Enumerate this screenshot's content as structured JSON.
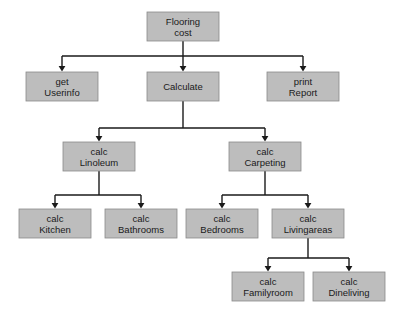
{
  "diagram": {
    "type": "structure-chart",
    "box_fill_color": "#bdbdbd",
    "box_border_color": "#8a8a8a",
    "connector_color": "#1a1a1a",
    "background_color": "#ffffff",
    "box_width": 72,
    "box_height": 29
  },
  "nodes": [
    {
      "id": "flooring-cost",
      "line1": "Flooring",
      "line2": "cost",
      "x": 147,
      "y": 12,
      "level": 0
    },
    {
      "id": "get-userinfo",
      "line1": "get",
      "line2": "Userinfo",
      "x": 26,
      "y": 72,
      "level": 1
    },
    {
      "id": "calculate",
      "line1": "Calculate",
      "line2": "",
      "x": 147,
      "y": 72,
      "level": 1
    },
    {
      "id": "print-report",
      "line1": "print",
      "line2": "Report",
      "x": 267,
      "y": 72,
      "level": 1
    },
    {
      "id": "calc-linoleum",
      "line1": "calc",
      "line2": "Linoleum",
      "x": 63,
      "y": 142,
      "level": 2
    },
    {
      "id": "calc-carpeting",
      "line1": "calc",
      "line2": "Carpeting",
      "x": 229,
      "y": 142,
      "level": 2
    },
    {
      "id": "calc-kitchen",
      "line1": "calc",
      "line2": "Kitchen",
      "x": 19,
      "y": 209,
      "level": 3
    },
    {
      "id": "calc-bathrooms",
      "line1": "calc",
      "line2": "Bathrooms",
      "x": 105,
      "y": 209,
      "level": 3
    },
    {
      "id": "calc-bedrooms",
      "line1": "calc",
      "line2": "Bedrooms",
      "x": 186,
      "y": 209,
      "level": 3
    },
    {
      "id": "calc-livingareas",
      "line1": "calc",
      "line2": "Livingareas",
      "x": 272,
      "y": 209,
      "level": 3
    },
    {
      "id": "calc-familyroom",
      "line1": "calc",
      "line2": "Familyroom",
      "x": 232,
      "y": 272,
      "level": 4
    },
    {
      "id": "calc-dineliving",
      "line1": "calc",
      "line2": "Dineliving",
      "x": 313,
      "y": 272,
      "level": 4
    }
  ],
  "edges": [
    {
      "id": "edge-flooring-to-level1",
      "parent": "flooring-cost",
      "children": [
        "get-userinfo",
        "calculate",
        "print-report"
      ],
      "bus_y": 56
    },
    {
      "id": "edge-calculate-to-level2",
      "parent": "calculate",
      "children": [
        "calc-linoleum",
        "calc-carpeting"
      ],
      "bus_y": 128
    },
    {
      "id": "edge-linoleum-to-level3",
      "parent": "calc-linoleum",
      "children": [
        "calc-kitchen",
        "calc-bathrooms"
      ],
      "bus_y": 195
    },
    {
      "id": "edge-carpeting-to-level3",
      "parent": "calc-carpeting",
      "children": [
        "calc-bedrooms",
        "calc-livingareas"
      ],
      "bus_y": 195
    },
    {
      "id": "edge-livingareas-to-level4",
      "parent": "calc-livingareas",
      "children": [
        "calc-familyroom",
        "calc-dineliving"
      ],
      "bus_y": 258
    }
  ]
}
